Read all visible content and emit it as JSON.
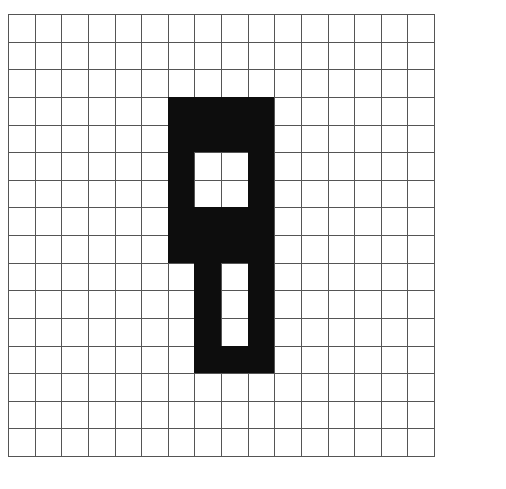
{
  "figure": {
    "type": "pixel-grid",
    "rows": 16,
    "cols": 16,
    "fill_color": "#0d0d0d",
    "empty_color": "#ffffff",
    "line_color": "#555555",
    "grid": [
      "0000000000000000",
      "0000000000000000",
      "0000000000000000",
      "0000001111000000",
      "0000001111000000",
      "0000001001000000",
      "0000001001000000",
      "0000001111000000",
      "0000001111000000",
      "0000000101000000",
      "0000000101000000",
      "0000000101000000",
      "0000000111000000",
      "0000000000000000",
      "0000000000000000",
      "0000000000000000"
    ]
  }
}
